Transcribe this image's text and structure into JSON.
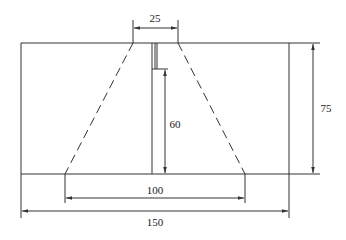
{
  "diagram": {
    "type": "engineering-section-drawing",
    "colors": {
      "line": "#333333",
      "background": "#ffffff"
    },
    "dimensions": {
      "top_width": "25",
      "total_height": "75",
      "slot_depth": "60",
      "bottom_width": "100",
      "total_width": "150"
    }
  }
}
